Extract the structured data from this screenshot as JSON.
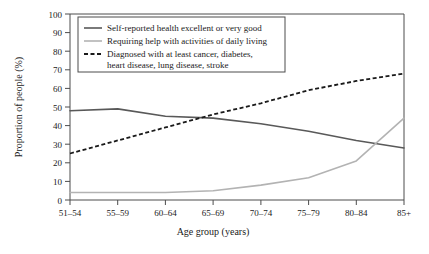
{
  "chart_data": {
    "type": "line",
    "title": "",
    "xlabel": "Age group (years)",
    "ylabel": "Proportion of people (%)",
    "categories": [
      "51–54",
      "55–59",
      "60–64",
      "65–69",
      "70–74",
      "75–79",
      "80–84",
      "85+"
    ],
    "ylim": [
      0,
      100
    ],
    "yticks": [
      "0",
      "10",
      "20",
      "30",
      "40",
      "50",
      "60",
      "70",
      "80",
      "90",
      "100"
    ],
    "grid": false,
    "legend_position": "top-left",
    "series": [
      {
        "name": "Self-reported health excellent or very good",
        "style": "solid",
        "color": "#595959",
        "values": [
          48,
          49,
          45,
          44,
          41,
          37,
          32,
          28
        ]
      },
      {
        "name": "Requiring help with activities of daily living",
        "style": "solid",
        "color": "#b3b3b3",
        "values": [
          4,
          4,
          4,
          5,
          8,
          12,
          21,
          44
        ]
      },
      {
        "name": "Diagnosed with at least cancer, diabetes, heart disease, lung disease, stroke",
        "style": "dashed",
        "color": "#1a1a1a",
        "values": [
          25,
          32,
          39,
          46,
          52,
          59,
          64,
          68
        ]
      }
    ]
  },
  "legend": {
    "entries": [
      {
        "label": "Self-reported health excellent or very good"
      },
      {
        "label": "Requiring help with activities of daily living"
      },
      {
        "label": "Diagnosed with at least cancer, diabetes,"
      },
      {
        "label": "heart disease, lung disease, stroke"
      }
    ]
  },
  "axes": {
    "y_title": "Proportion of people (%)",
    "x_title": "Age group (years)",
    "y_ticks": [
      "100",
      "90",
      "80",
      "70",
      "60",
      "50",
      "40",
      "30",
      "20",
      "10",
      "0"
    ],
    "x_ticks": [
      "51–54",
      "55–59",
      "60–64",
      "65–69",
      "70–74",
      "75–79",
      "80–84",
      "85+"
    ]
  },
  "colors": {
    "series_dark": "#595959",
    "series_light": "#b3b3b3",
    "series_dashed": "#1a1a1a",
    "axis": "#4d4d4d",
    "text": "#1a1a1a",
    "background": "#ffffff"
  }
}
